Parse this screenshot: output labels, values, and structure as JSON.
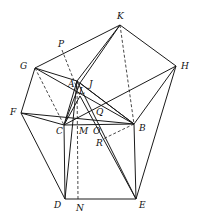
{
  "diagram": {
    "points": {
      "K": [
        120,
        25
      ],
      "P": [
        62,
        50
      ],
      "G": [
        35,
        68
      ],
      "H": [
        176,
        66
      ],
      "A": [
        77,
        81
      ],
      "J": [
        80,
        83
      ],
      "L": [
        80,
        96
      ],
      "F": [
        21,
        113
      ],
      "C": [
        64,
        125
      ],
      "M": [
        78,
        125
      ],
      "O": [
        96,
        124
      ],
      "Q": [
        98,
        113
      ],
      "B": [
        134,
        124
      ],
      "R": [
        103,
        139
      ],
      "D": [
        65,
        199
      ],
      "N": [
        78,
        199
      ],
      "E": [
        136,
        199
      ]
    },
    "solid_lines": [
      [
        "G",
        "K"
      ],
      [
        "K",
        "H"
      ],
      [
        "H",
        "B"
      ],
      [
        "H",
        "E"
      ],
      [
        "G",
        "F"
      ],
      [
        "F",
        "D"
      ],
      [
        "C",
        "D"
      ],
      [
        "D",
        "E"
      ],
      [
        "E",
        "B"
      ],
      [
        "C",
        "B"
      ],
      [
        "A",
        "K"
      ],
      [
        "J",
        "K"
      ],
      [
        "A",
        "C"
      ],
      [
        "A",
        "B"
      ],
      [
        "J",
        "C"
      ],
      [
        "G",
        "A"
      ],
      [
        "G",
        "B"
      ],
      [
        "F",
        "B"
      ],
      [
        "F",
        "C"
      ],
      [
        "C",
        "H"
      ],
      [
        "A",
        "E"
      ],
      [
        "A",
        "D"
      ],
      [
        "L",
        "E"
      ],
      [
        "J",
        "B"
      ],
      [
        "C",
        "L"
      ]
    ],
    "dashed_lines": [
      [
        "P",
        "L"
      ],
      [
        "G",
        "C"
      ],
      [
        "K",
        "B"
      ],
      [
        "B",
        "R"
      ],
      [
        "A",
        "N"
      ]
    ],
    "labels": [
      {
        "text": "K",
        "x": 117,
        "y": 12
      },
      {
        "text": "P",
        "x": 58,
        "y": 40
      },
      {
        "text": "G",
        "x": 20,
        "y": 62
      },
      {
        "text": "H",
        "x": 181,
        "y": 62
      },
      {
        "text": "A",
        "x": 68,
        "y": 80
      },
      {
        "text": "J",
        "x": 89,
        "y": 80
      },
      {
        "text": "L",
        "x": 79,
        "y": 87
      },
      {
        "text": "F",
        "x": 10,
        "y": 108
      },
      {
        "text": "Q",
        "x": 96,
        "y": 108
      },
      {
        "text": "C",
        "x": 56,
        "y": 127
      },
      {
        "text": "M",
        "x": 79,
        "y": 127
      },
      {
        "text": "O",
        "x": 93,
        "y": 127
      },
      {
        "text": "B",
        "x": 139,
        "y": 124
      },
      {
        "text": "R",
        "x": 96,
        "y": 139
      },
      {
        "text": "D",
        "x": 54,
        "y": 201
      },
      {
        "text": "N",
        "x": 76,
        "y": 204
      },
      {
        "text": "E",
        "x": 139,
        "y": 201
      }
    ]
  }
}
